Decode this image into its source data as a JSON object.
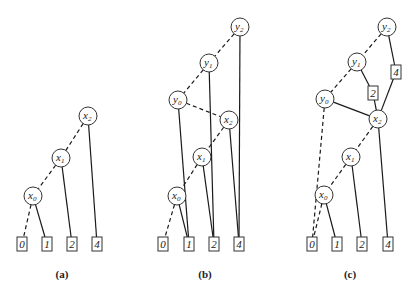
{
  "figure": {
    "panels": [
      {
        "id": "a",
        "caption": "(a)",
        "caption_pos": [
          62,
          278
        ],
        "nodes": [
          {
            "id": "x2",
            "base": "x",
            "sub": "2",
            "cx": 88,
            "cy": 116
          },
          {
            "id": "x1",
            "base": "x",
            "sub": "1",
            "cx": 61,
            "cy": 158
          },
          {
            "id": "x0",
            "base": "x",
            "sub": "0",
            "cx": 33,
            "cy": 196
          }
        ],
        "leaves": [
          {
            "id": "L0",
            "label": "0",
            "x": 17,
            "y": 237
          },
          {
            "id": "L1",
            "label": "1",
            "x": 42,
            "y": 237
          },
          {
            "id": "L2",
            "label": "2",
            "x": 67,
            "y": 237
          },
          {
            "id": "L4",
            "label": "4",
            "x": 92,
            "y": 237
          }
        ],
        "edges": [
          {
            "from": "x2",
            "to": "x1",
            "style": "dashed"
          },
          {
            "from": "x2",
            "to": "L4",
            "style": "solid"
          },
          {
            "from": "x1",
            "to": "x0",
            "style": "dashed"
          },
          {
            "from": "x1",
            "to": "L2",
            "style": "solid"
          },
          {
            "from": "x0",
            "to": "L0",
            "style": "dashed"
          },
          {
            "from": "x0",
            "to": "L1",
            "style": "solid"
          }
        ]
      },
      {
        "id": "b",
        "caption": "(b)",
        "caption_pos": [
          205,
          278
        ],
        "nodes": [
          {
            "id": "y2",
            "base": "y",
            "sub": "2",
            "cx": 240,
            "cy": 27
          },
          {
            "id": "y1",
            "base": "y",
            "sub": "1",
            "cx": 209,
            "cy": 63
          },
          {
            "id": "y0",
            "base": "y",
            "sub": "0",
            "cx": 178,
            "cy": 100
          },
          {
            "id": "x2",
            "base": "x",
            "sub": "2",
            "cx": 229,
            "cy": 120
          },
          {
            "id": "x1",
            "base": "x",
            "sub": "1",
            "cx": 202,
            "cy": 157
          },
          {
            "id": "x0",
            "base": "x",
            "sub": "0",
            "cx": 177,
            "cy": 196
          }
        ],
        "leaves": [
          {
            "id": "L0",
            "label": "0",
            "x": 158,
            "y": 237
          },
          {
            "id": "L1",
            "label": "1",
            "x": 184,
            "y": 237
          },
          {
            "id": "L2",
            "label": "2",
            "x": 209,
            "y": 237
          },
          {
            "id": "L4",
            "label": "4",
            "x": 234,
            "y": 237
          }
        ],
        "edges": [
          {
            "from": "y2",
            "to": "y1",
            "style": "dashed"
          },
          {
            "from": "y2",
            "to": "L4",
            "style": "solid"
          },
          {
            "from": "y1",
            "to": "y0",
            "style": "dashed"
          },
          {
            "from": "y1",
            "to": "L2",
            "style": "solid"
          },
          {
            "from": "y0",
            "to": "x2",
            "style": "dashed"
          },
          {
            "from": "y0",
            "to": "L1",
            "style": "solid"
          },
          {
            "from": "x2",
            "to": "x1",
            "style": "dashed"
          },
          {
            "from": "x2",
            "to": "L4",
            "style": "solid"
          },
          {
            "from": "x1",
            "to": "x0",
            "style": "dashed"
          },
          {
            "from": "x1",
            "to": "L2",
            "style": "solid"
          },
          {
            "from": "x0",
            "to": "L0",
            "style": "dashed"
          },
          {
            "from": "x0",
            "to": "L1",
            "style": "solid"
          }
        ]
      },
      {
        "id": "c",
        "caption": "(c)",
        "caption_pos": [
          350,
          278
        ],
        "nodes": [
          {
            "id": "y2",
            "base": "y",
            "sub": "2",
            "cx": 387,
            "cy": 27
          },
          {
            "id": "y1",
            "base": "y",
            "sub": "1",
            "cx": 357,
            "cy": 62
          },
          {
            "id": "y0",
            "base": "y",
            "sub": "0",
            "cx": 325,
            "cy": 99
          },
          {
            "id": "x2",
            "base": "x",
            "sub": "2",
            "cx": 378,
            "cy": 119
          },
          {
            "id": "x1",
            "base": "x",
            "sub": "1",
            "cx": 351,
            "cy": 157
          },
          {
            "id": "x0",
            "base": "x",
            "sub": "0",
            "cx": 324,
            "cy": 195
          }
        ],
        "leaves": [
          {
            "id": "M4",
            "label": "4",
            "x": 391,
            "y": 65
          },
          {
            "id": "M2",
            "label": "2",
            "x": 368,
            "y": 86
          },
          {
            "id": "L0",
            "label": "0",
            "x": 307,
            "y": 237
          },
          {
            "id": "L1",
            "label": "1",
            "x": 332,
            "y": 237
          },
          {
            "id": "L2",
            "label": "2",
            "x": 357,
            "y": 237
          },
          {
            "id": "L4",
            "label": "4",
            "x": 383,
            "y": 237
          }
        ],
        "edges": [
          {
            "from": "y2",
            "to": "y1",
            "style": "dashed"
          },
          {
            "from": "y2",
            "to": "M4",
            "style": "solid"
          },
          {
            "from": "y1",
            "to": "y0",
            "style": "dashed"
          },
          {
            "from": "y1",
            "to": "M2",
            "style": "solid"
          },
          {
            "from": "M4",
            "to": "x2",
            "style": "solid"
          },
          {
            "from": "M2",
            "to": "x2",
            "style": "solid"
          },
          {
            "from": "y0",
            "to": "x2",
            "style": "solid"
          },
          {
            "from": "y0",
            "to": "L0",
            "style": "dashed"
          },
          {
            "from": "x2",
            "to": "x1",
            "style": "dashed"
          },
          {
            "from": "x2",
            "to": "L4",
            "style": "solid"
          },
          {
            "from": "x1",
            "to": "x0",
            "style": "dashed"
          },
          {
            "from": "x1",
            "to": "L2",
            "style": "solid"
          },
          {
            "from": "x0",
            "to": "L0",
            "style": "dashed"
          },
          {
            "from": "x0",
            "to": "L1",
            "style": "solid"
          }
        ]
      }
    ],
    "style": {
      "node_radius": 9,
      "leaf_width": 10,
      "leaf_height": 14,
      "stroke_color": "#1a1a1a",
      "background": "#ffffff"
    }
  }
}
